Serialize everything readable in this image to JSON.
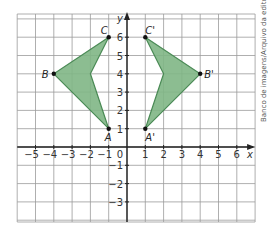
{
  "diagram": {
    "x_axis_label": "x",
    "y_axis_label": "y",
    "origin_label": "0",
    "x_ticks": [
      "−5",
      "−4",
      "−3",
      "−2",
      "−1",
      "1",
      "2",
      "3",
      "4",
      "5",
      "6"
    ],
    "y_ticks": [
      "6",
      "5",
      "4",
      "3",
      "2",
      "1",
      "−1",
      "−2",
      "−3"
    ],
    "x_range": [
      -6,
      7
    ],
    "y_range": [
      -4,
      7
    ],
    "fill_color": "#7fb685",
    "stroke_color": "#4a8a55",
    "polygon_original": {
      "vertices": [
        {
          "label": "A",
          "x": -1,
          "y": 1
        },
        {
          "label": "B",
          "x": -4,
          "y": 4
        },
        {
          "label": "C",
          "x": -1,
          "y": 6
        }
      ],
      "notch": {
        "x": -2,
        "y": 4
      }
    },
    "polygon_image": {
      "vertices": [
        {
          "label": "A'",
          "x": 1,
          "y": 1
        },
        {
          "label": "B'",
          "x": 4,
          "y": 4
        },
        {
          "label": "C'",
          "x": 1,
          "y": 6
        }
      ],
      "notch": {
        "x": 2,
        "y": 4
      }
    }
  },
  "credit": "Banco de imagens/Arquivo da editora"
}
